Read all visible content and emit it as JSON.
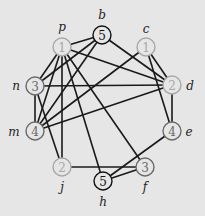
{
  "diagram": {
    "type": "graph",
    "nodes": [
      {
        "id": "p",
        "value": "1",
        "x": 62,
        "y": 47,
        "style": "light",
        "name_x": 62,
        "name_y": 27
      },
      {
        "id": "b",
        "value": "5",
        "x": 102,
        "y": 35,
        "style": "dark",
        "name_x": 102,
        "name_y": 15
      },
      {
        "id": "c",
        "value": "1",
        "x": 146,
        "y": 47,
        "style": "light",
        "name_x": 146,
        "name_y": 29
      },
      {
        "id": "n",
        "value": "3",
        "x": 35,
        "y": 86,
        "style": "medium",
        "name_x": 16,
        "name_y": 86
      },
      {
        "id": "d",
        "value": "2",
        "x": 172,
        "y": 85,
        "style": "light",
        "name_x": 190,
        "name_y": 86
      },
      {
        "id": "m",
        "value": "4",
        "x": 35,
        "y": 131,
        "style": "medium",
        "name_x": 14,
        "name_y": 132
      },
      {
        "id": "e",
        "value": "4",
        "x": 172,
        "y": 131,
        "style": "medium",
        "name_x": 189,
        "name_y": 132
      },
      {
        "id": "j",
        "value": "2",
        "x": 62,
        "y": 167,
        "style": "light",
        "name_x": 62,
        "name_y": 187
      },
      {
        "id": "f",
        "value": "3",
        "x": 145,
        "y": 167,
        "style": "medium",
        "name_x": 145,
        "name_y": 187
      },
      {
        "id": "h",
        "value": "5",
        "x": 103,
        "y": 181,
        "style": "dark",
        "name_x": 103,
        "name_y": 202
      }
    ],
    "edges": [
      [
        "p",
        "b"
      ],
      [
        "p",
        "d"
      ],
      [
        "p",
        "n"
      ],
      [
        "p",
        "m"
      ],
      [
        "p",
        "j"
      ],
      [
        "p",
        "h"
      ],
      [
        "p",
        "f"
      ],
      [
        "b",
        "n"
      ],
      [
        "b",
        "m"
      ],
      [
        "b",
        "d"
      ],
      [
        "c",
        "m"
      ],
      [
        "c",
        "d"
      ],
      [
        "c",
        "e"
      ],
      [
        "n",
        "d"
      ],
      [
        "n",
        "m"
      ],
      [
        "n",
        "j"
      ],
      [
        "m",
        "d"
      ],
      [
        "d",
        "e"
      ],
      [
        "e",
        "h"
      ],
      [
        "j",
        "f"
      ],
      [
        "h",
        "f"
      ]
    ],
    "colors": {
      "background": "#e6e6e6",
      "edge": "#1a1a1a",
      "dark_stroke": "#111111",
      "medium_stroke": "#6a6a6a",
      "light_stroke": "#a8a8a8"
    }
  }
}
